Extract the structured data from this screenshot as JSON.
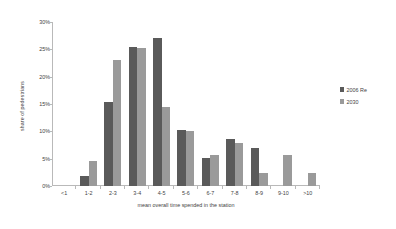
{
  "chart_data": {
    "type": "bar",
    "title": "",
    "xlabel": "mean overall time spended in the station",
    "ylabel": "share of pedestrians",
    "categories": [
      "<1",
      "1-2",
      "2-3",
      "3-4",
      "4-5",
      "5-6",
      "6-7",
      "7-8",
      "8-9",
      "9-10",
      ">10"
    ],
    "series": [
      {
        "name": "2006 Re",
        "color": "#5a5a5a",
        "values": [
          0,
          1.8,
          15.3,
          25.5,
          27.1,
          10.3,
          5.1,
          8.6,
          7.0,
          0,
          0
        ]
      },
      {
        "name": "2030",
        "color": "#9a9a9a",
        "values": [
          0,
          4.5,
          23.1,
          25.2,
          14.4,
          10.0,
          5.6,
          7.8,
          2.3,
          5.6,
          2.3
        ]
      }
    ],
    "ylim": [
      0,
      30
    ],
    "yticks": [
      0,
      5,
      10,
      15,
      20,
      25,
      30
    ],
    "ytick_labels": [
      "0%",
      "5%",
      "10%",
      "15%",
      "20%",
      "25%",
      "30%"
    ],
    "grid": false,
    "legend_position": "right"
  }
}
